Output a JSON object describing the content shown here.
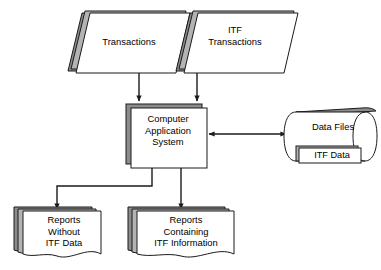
{
  "diagram": {
    "type": "flowchart",
    "colors": {
      "stroke": "#1a1a1a",
      "fill": "#ffffff",
      "shadow": "#8c8c8c",
      "shadow_light": "#b3b3b3",
      "background": "#ffffff",
      "text": "#000000"
    },
    "nodes": [
      {
        "id": "transactions",
        "label": "Transactions",
        "shape": "parallelogram-stack",
        "role": "input"
      },
      {
        "id": "itf-transactions",
        "label": "ITF\nTransactions",
        "shape": "parallelogram-stack",
        "role": "input"
      },
      {
        "id": "computer-application-system",
        "label": "Computer\nApplication\nSystem",
        "shape": "rectangle-stack",
        "role": "process"
      },
      {
        "id": "data-files",
        "label": "Data Files",
        "shape": "cylinder",
        "role": "storage"
      },
      {
        "id": "itf-data",
        "label": "ITF Data",
        "shape": "rectangle",
        "role": "storage-partition"
      },
      {
        "id": "reports-without-itf-data",
        "label": "Reports\nWithout\nITF Data",
        "shape": "document-stack",
        "role": "output"
      },
      {
        "id": "reports-containing-itf-information",
        "label": "Reports\nContaining\nITF Information",
        "shape": "document-stack",
        "role": "output"
      }
    ],
    "connectors": [
      {
        "id": "transactions-to-system",
        "from": "transactions",
        "to": "computer-application-system",
        "arrow": "single"
      },
      {
        "id": "itf-transactions-to-system",
        "from": "itf-transactions",
        "to": "computer-application-system",
        "arrow": "single"
      },
      {
        "id": "system-to-data-files",
        "from": "computer-application-system",
        "to": "data-files",
        "arrow": "double"
      },
      {
        "id": "system-to-reports-without",
        "from": "computer-application-system",
        "to": "reports-without-itf-data",
        "arrow": "single"
      },
      {
        "id": "system-to-reports-containing",
        "from": "computer-application-system",
        "to": "reports-containing-itf-information",
        "arrow": "single"
      }
    ]
  }
}
